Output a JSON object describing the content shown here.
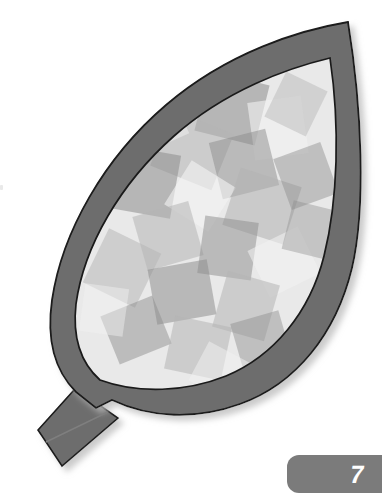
{
  "page": {
    "background_color": "#ffffff",
    "width": 382,
    "height": 498
  },
  "illustration": {
    "name": "leaf-mosaic",
    "description": "Outlined leaf shape with thick gray border filled with overlapping translucent gray squares, plus a diagonal stem at lower left",
    "colors": {
      "border_band": "#6d6d6d",
      "outline_stroke": "#1a1a1a",
      "interior_base": "#e9e9e9",
      "shadow": "#d9d9d9",
      "mosaic_light": "#f2f2f2",
      "mosaic_mid": "#b4b4b4",
      "mosaic_dark": "#8c8c8c"
    },
    "leaf_outer_path": "M 348 22 C 300 30 228 52 166 105 C 104 158 62 232 52 300 C 46 342 56 372 76 392 L 96 408 L 112 400 C 150 418 196 420 240 404 C 296 384 336 334 352 268 C 366 208 362 108 348 22 Z",
    "leaf_inner_path": "M 330 58 C 288 68 226 90 174 136 C 120 184 84 246 76 304 C 72 340 82 364 100 380 C 138 394 186 392 226 376 C 274 356 310 312 324 256 C 338 200 340 126 330 58 Z",
    "stem_path": "M 98 404 L 74 390 L 38 430 L 62 466 L 118 418 Z",
    "vein_color": "#7f7f7f",
    "mosaic_tiles": [
      {
        "cx": 232,
        "cy": 108,
        "w": 62,
        "h": 62,
        "rot": 14,
        "fill": "#8c8c8c",
        "op": 0.55
      },
      {
        "cx": 278,
        "cy": 128,
        "w": 54,
        "h": 58,
        "rot": -8,
        "fill": "#f2f2f2",
        "op": 0.6
      },
      {
        "cx": 192,
        "cy": 150,
        "w": 66,
        "h": 60,
        "rot": 22,
        "fill": "#b4b4b4",
        "op": 0.55
      },
      {
        "cx": 244,
        "cy": 164,
        "w": 58,
        "h": 58,
        "rot": -14,
        "fill": "#8c8c8c",
        "op": 0.5
      },
      {
        "cx": 146,
        "cy": 182,
        "w": 60,
        "h": 64,
        "rot": 10,
        "fill": "#8c8c8c",
        "op": 0.55
      },
      {
        "cx": 200,
        "cy": 196,
        "w": 52,
        "h": 52,
        "rot": 32,
        "fill": "#f2f2f2",
        "op": 0.62
      },
      {
        "cx": 262,
        "cy": 206,
        "w": 64,
        "h": 60,
        "rot": 18,
        "fill": "#b4b4b4",
        "op": 0.58
      },
      {
        "cx": 306,
        "cy": 176,
        "w": 50,
        "h": 54,
        "rot": -20,
        "fill": "#8c8c8c",
        "op": 0.45
      },
      {
        "cx": 168,
        "cy": 236,
        "w": 58,
        "h": 56,
        "rot": -16,
        "fill": "#b4b4b4",
        "op": 0.55
      },
      {
        "cx": 228,
        "cy": 248,
        "w": 54,
        "h": 58,
        "rot": 8,
        "fill": "#8c8c8c",
        "op": 0.5
      },
      {
        "cx": 284,
        "cy": 262,
        "w": 56,
        "h": 52,
        "rot": -26,
        "fill": "#f2f2f2",
        "op": 0.55
      },
      {
        "cx": 122,
        "cy": 268,
        "w": 58,
        "h": 60,
        "rot": 26,
        "fill": "#b4b4b4",
        "op": 0.5
      },
      {
        "cx": 182,
        "cy": 292,
        "w": 60,
        "h": 56,
        "rot": -10,
        "fill": "#8c8c8c",
        "op": 0.52
      },
      {
        "cx": 246,
        "cy": 306,
        "w": 54,
        "h": 58,
        "rot": 16,
        "fill": "#b4b4b4",
        "op": 0.55
      },
      {
        "cx": 136,
        "cy": 330,
        "w": 56,
        "h": 52,
        "rot": -22,
        "fill": "#8c8c8c",
        "op": 0.48
      },
      {
        "cx": 198,
        "cy": 348,
        "w": 58,
        "h": 54,
        "rot": 12,
        "fill": "#b4b4b4",
        "op": 0.55
      },
      {
        "cx": 262,
        "cy": 344,
        "w": 50,
        "h": 56,
        "rot": -16,
        "fill": "#8c8c8c",
        "op": 0.45
      },
      {
        "cx": 296,
        "cy": 104,
        "w": 46,
        "h": 50,
        "rot": 26,
        "fill": "#b4b4b4",
        "op": 0.45
      },
      {
        "cx": 158,
        "cy": 122,
        "w": 48,
        "h": 46,
        "rot": -24,
        "fill": "#f2f2f2",
        "op": 0.5
      },
      {
        "cx": 220,
        "cy": 372,
        "w": 48,
        "h": 44,
        "rot": 28,
        "fill": "#f2f2f2",
        "op": 0.5
      },
      {
        "cx": 104,
        "cy": 310,
        "w": 44,
        "h": 48,
        "rot": 8,
        "fill": "#f2f2f2",
        "op": 0.45
      },
      {
        "cx": 310,
        "cy": 230,
        "w": 46,
        "h": 50,
        "rot": 14,
        "fill": "#8c8c8c",
        "op": 0.4
      }
    ]
  },
  "page_badge": {
    "number": "7",
    "background_color": "#7b7b7b",
    "text_color": "#ffffff"
  }
}
